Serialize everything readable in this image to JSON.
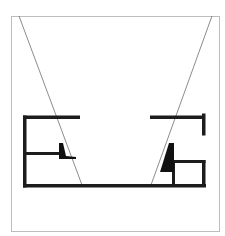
{
  "diagram": {
    "type": "architectural-plan-section",
    "colors": {
      "background": "#ffffff",
      "frame": "#bdbdbd",
      "walls": "#1c1c1c",
      "sightlines": "#6e6e6e"
    },
    "elements": [
      {
        "id": "frame",
        "kind": "border"
      },
      {
        "id": "left-sightline",
        "kind": "thin-line"
      },
      {
        "id": "right-sightline",
        "kind": "thin-line"
      },
      {
        "id": "left-structure",
        "kind": "wall-group",
        "parts": [
          "top-wall",
          "vertical-wall",
          "middle-wall",
          "wedge"
        ]
      },
      {
        "id": "right-structure",
        "kind": "wall-group",
        "parts": [
          "top-wall",
          "end-post",
          "box-room",
          "wedge"
        ]
      },
      {
        "id": "floor-wall",
        "kind": "wall"
      }
    ]
  }
}
